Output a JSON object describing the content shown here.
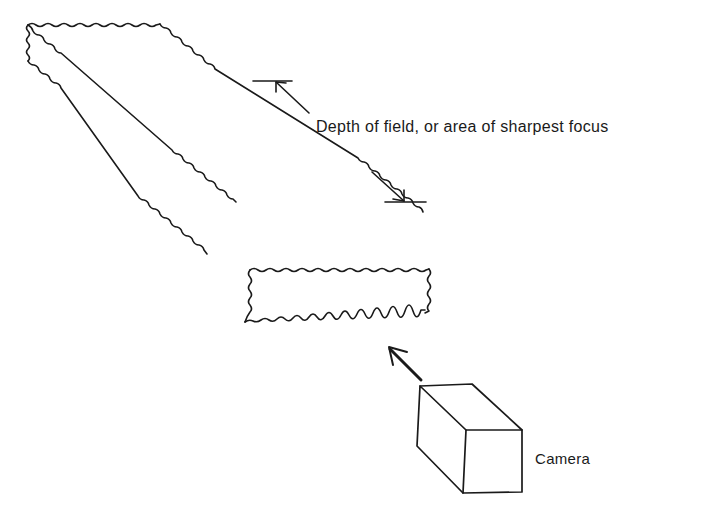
{
  "diagram": {
    "labels": {
      "depth_of_field": "Depth of field, or area of sharpest focus",
      "camera": "Camera"
    },
    "elements": [
      {
        "name": "focus-slab",
        "description": "Rectangular slab with wavy (blurred) edges representing the zone of sharp focus"
      },
      {
        "name": "depth-dimension-markers",
        "description": "Two tick bars with arrows pointing to them, marking extent of depth of field"
      },
      {
        "name": "camera-box",
        "description": "Box representing the camera"
      },
      {
        "name": "view-direction-arrow",
        "description": "Arrow from camera pointing toward the slab"
      }
    ],
    "colors": {
      "ink": "#1a1a1a",
      "background": "#ffffff"
    }
  }
}
